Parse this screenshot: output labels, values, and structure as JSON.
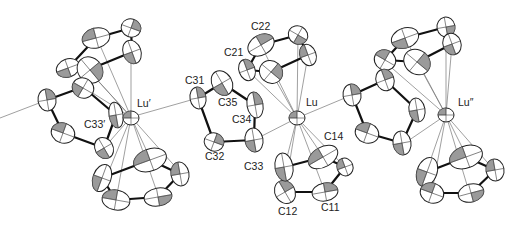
{
  "figure": {
    "type": "ORTEP crystal structure diagram",
    "metal_labels": {
      "lu_left": "Lu′",
      "lu_center": "Lu",
      "lu_right": "Lu″"
    },
    "atom_labels": {
      "c33_prime": "C33′",
      "c31": "C31",
      "c35": "C35",
      "c34": "C34",
      "c33": "C33",
      "c32": "C32",
      "c21": "C21",
      "c22": "C22",
      "c14": "C14",
      "c11": "C11",
      "c12": "C12"
    },
    "colors": {
      "bond": "#111111",
      "thin_contact": "#777777",
      "ellipsoid_fill": "#ffffff",
      "octant_shading": "#9a9a9a",
      "background": "#ffffff"
    }
  }
}
